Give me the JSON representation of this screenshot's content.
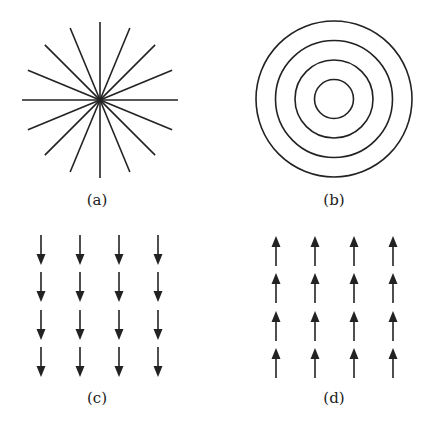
{
  "figure": {
    "panels": [
      {
        "id": "a",
        "label": "(a)",
        "type": "radial-lines",
        "description": "16 straight lines radiating from a common center",
        "center": [
          100,
          100
        ],
        "radius": 78,
        "spoke_count": 16,
        "label_pos": [
          97,
          205
        ]
      },
      {
        "id": "b",
        "label": "(b)",
        "type": "concentric-circles",
        "description": "4 concentric circles",
        "center": [
          334,
          99
        ],
        "radii": [
          19.5,
          39,
          58.5,
          78
        ],
        "label_pos": [
          334,
          205
        ]
      },
      {
        "id": "c",
        "label": "(c)",
        "type": "arrow-grid",
        "direction": "down",
        "description": "4x4 grid of arrows pointing downward",
        "columns_x": [
          41,
          80,
          119,
          158
        ],
        "rows_y": [
          235,
          272,
          310,
          347
        ],
        "arrow_length": 30,
        "label_pos": [
          97,
          403
        ]
      },
      {
        "id": "d",
        "label": "(d)",
        "type": "arrow-grid",
        "direction": "up",
        "description": "4x4 grid of arrows pointing upward",
        "columns_x": [
          276,
          315,
          354,
          393
        ],
        "rows_y": [
          236,
          273,
          311,
          348
        ],
        "arrow_length": 30,
        "label_pos": [
          334,
          403
        ]
      }
    ],
    "colors": {
      "ink": "#222222",
      "background": "#ffffff"
    }
  }
}
